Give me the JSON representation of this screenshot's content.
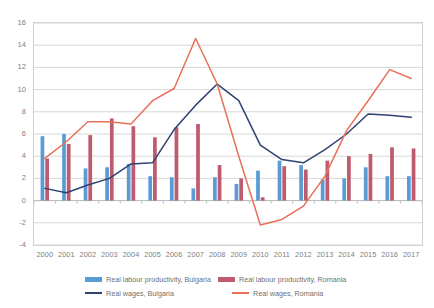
{
  "chart_data": {
    "type": "bar",
    "title": "",
    "xlabel": "",
    "ylabel": "",
    "ylim": [
      -4,
      16
    ],
    "ytick_step": 2,
    "grid": true,
    "legend_position": "bottom",
    "categories": [
      "2000",
      "2001",
      "2002",
      "2003",
      "2004",
      "2005",
      "2006",
      "2007",
      "2008",
      "2009",
      "2010",
      "2011",
      "2012",
      "2013",
      "2014",
      "2015",
      "2016",
      "2017"
    ],
    "yticks": [
      "16",
      "14",
      "12",
      "10",
      "8",
      "6",
      "4",
      "2",
      "0",
      "-2",
      "-4"
    ],
    "series": [
      {
        "name": "Real labour productivity, Bulgaria",
        "kind": "bar",
        "color": "#5B9BD5",
        "values": [
          5.8,
          6.0,
          2.9,
          3.0,
          3.3,
          2.2,
          2.1,
          1.1,
          2.1,
          1.5,
          2.7,
          3.6,
          3.2,
          1.9,
          2.0,
          3.0,
          2.2,
          2.2
        ]
      },
      {
        "name": "Real labour productivity, Romania",
        "kind": "bar",
        "color": "#BE5B6E",
        "values": [
          3.8,
          5.1,
          5.9,
          7.4,
          6.7,
          5.7,
          6.6,
          6.9,
          3.2,
          2.0,
          0.3,
          3.1,
          2.8,
          3.6,
          4.0,
          4.2,
          4.8,
          4.7
        ]
      },
      {
        "name": "Real wages, Bulgaria",
        "kind": "line",
        "color": "#2E4374",
        "values": [
          1.1,
          0.7,
          1.4,
          2.0,
          3.3,
          3.4,
          6.4,
          8.6,
          10.5,
          9.0,
          5.0,
          3.7,
          3.4,
          4.6,
          6.0,
          7.8,
          7.7,
          7.5
        ]
      },
      {
        "name": "Real wages, Romania",
        "kind": "line",
        "color": "#E8705A",
        "values": [
          3.8,
          5.3,
          7.1,
          7.1,
          6.9,
          9.0,
          10.1,
          14.6,
          10.5,
          4.0,
          -2.2,
          -1.7,
          -0.5,
          2.2,
          6.3,
          9.0,
          11.8,
          11.0
        ]
      }
    ],
    "legend": [
      {
        "label": "Real labour productivity, Bulgaria",
        "color": "#5B9BD5",
        "marker": "bar"
      },
      {
        "label": "Real labour productivity, Romania",
        "color": "#BE5B6E",
        "marker": "bar"
      },
      {
        "label": "Real wages, Bulgaria",
        "color": "#2E4374",
        "marker": "line"
      },
      {
        "label": "Real wages, Romania",
        "color": "#E8705A",
        "marker": "line"
      }
    ]
  }
}
